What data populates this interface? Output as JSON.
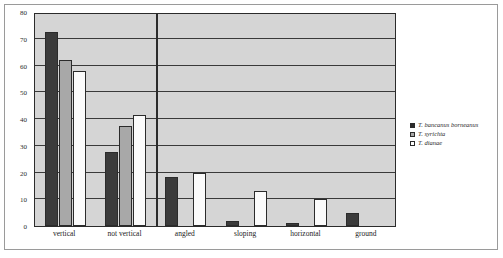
{
  "chart_data": {
    "type": "bar",
    "title": "",
    "xlabel": "",
    "ylabel": "",
    "ylim": [
      0,
      80
    ],
    "yticks": [
      0,
      10,
      20,
      30,
      40,
      50,
      60,
      70,
      80
    ],
    "grid": true,
    "legend_position": "right",
    "categories": [
      "vertical",
      "not vertical",
      "angled",
      "sloping",
      "horizontal",
      "ground"
    ],
    "series": [
      {
        "name": "T. bancanus borneanus",
        "color": "#3b3b3b",
        "values": [
          72.5,
          27.5,
          18.5,
          2,
          1,
          5
        ]
      },
      {
        "name": "T. syrichta",
        "color": "#a8a8a8",
        "values": [
          62,
          37.5,
          null,
          null,
          null,
          null
        ]
      },
      {
        "name": "T. dianae",
        "color": "#fbfbfb",
        "values": [
          58,
          41.5,
          20,
          13,
          10,
          null
        ]
      }
    ],
    "annotations": [
      {
        "name": "group-divider",
        "type": "vertical-line",
        "after_category": "not vertical"
      }
    ]
  },
  "legend": {
    "entries": [
      {
        "label": "T. bancanus borneanus",
        "swatch": "filled-dark-square"
      },
      {
        "label": "T. syrichta",
        "swatch": "filled-gray-square"
      },
      {
        "label": "T. dianae",
        "swatch": "outlined-white-square"
      }
    ]
  },
  "colors": {
    "plot_background": "#d5d5d5",
    "axis": "#2b2b2b",
    "gridline": "#3a3a3a",
    "frame": "#9a9a9a",
    "page_background": "#ffffff"
  }
}
